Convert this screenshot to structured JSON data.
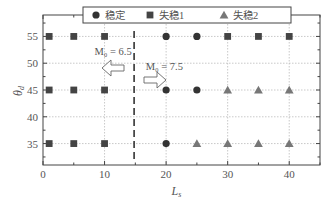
{
  "chart_data": {
    "type": "scatter",
    "title": "",
    "xlabel": "L_s",
    "ylabel": "θ_d",
    "xlim": [
      0,
      45
    ],
    "ylim": [
      31,
      59
    ],
    "xticks": [
      0,
      10,
      20,
      30,
      40
    ],
    "yticks": [
      35,
      40,
      45,
      50,
      55
    ],
    "grid": true,
    "legend_position": "top",
    "series": [
      {
        "name": "稳定",
        "marker": "circle",
        "color": "#333333",
        "points": [
          [
            20,
            55
          ],
          [
            25,
            55
          ],
          [
            20,
            45
          ],
          [
            25,
            45
          ],
          [
            20,
            35
          ]
        ]
      },
      {
        "name": "失稳1",
        "marker": "square",
        "color": "#444444",
        "points": [
          [
            1,
            55
          ],
          [
            5,
            55
          ],
          [
            10,
            55
          ],
          [
            30,
            55
          ],
          [
            35,
            55
          ],
          [
            40,
            55
          ],
          [
            1,
            45
          ],
          [
            5,
            45
          ],
          [
            10,
            45
          ],
          [
            1,
            35
          ],
          [
            5,
            35
          ],
          [
            10,
            35
          ]
        ]
      },
      {
        "name": "失稳2",
        "marker": "triangle",
        "color": "#777777",
        "points": [
          [
            30,
            45
          ],
          [
            35,
            45
          ],
          [
            40,
            45
          ],
          [
            25,
            35
          ],
          [
            30,
            35
          ],
          [
            35,
            35
          ],
          [
            40,
            35
          ]
        ]
      }
    ],
    "annotations": [
      {
        "text": "M₀ = 6.5",
        "x": 9,
        "y": 52.3,
        "arrow": "left"
      },
      {
        "text": "M₀ = 7.5",
        "x": 17,
        "y": 49.4,
        "arrow": "right"
      },
      {
        "type": "vline",
        "x": 14.8,
        "style": "dashed"
      }
    ]
  },
  "labels": {
    "xlabel_main": "L",
    "xlabel_sub": "s",
    "ylabel_main": "θ",
    "ylabel_sub": "d",
    "legend": [
      "稳定",
      "失稳1",
      "失稳2"
    ],
    "annot_left": "M₀ = 6.5",
    "annot_right": "M₀ = 7.5"
  }
}
